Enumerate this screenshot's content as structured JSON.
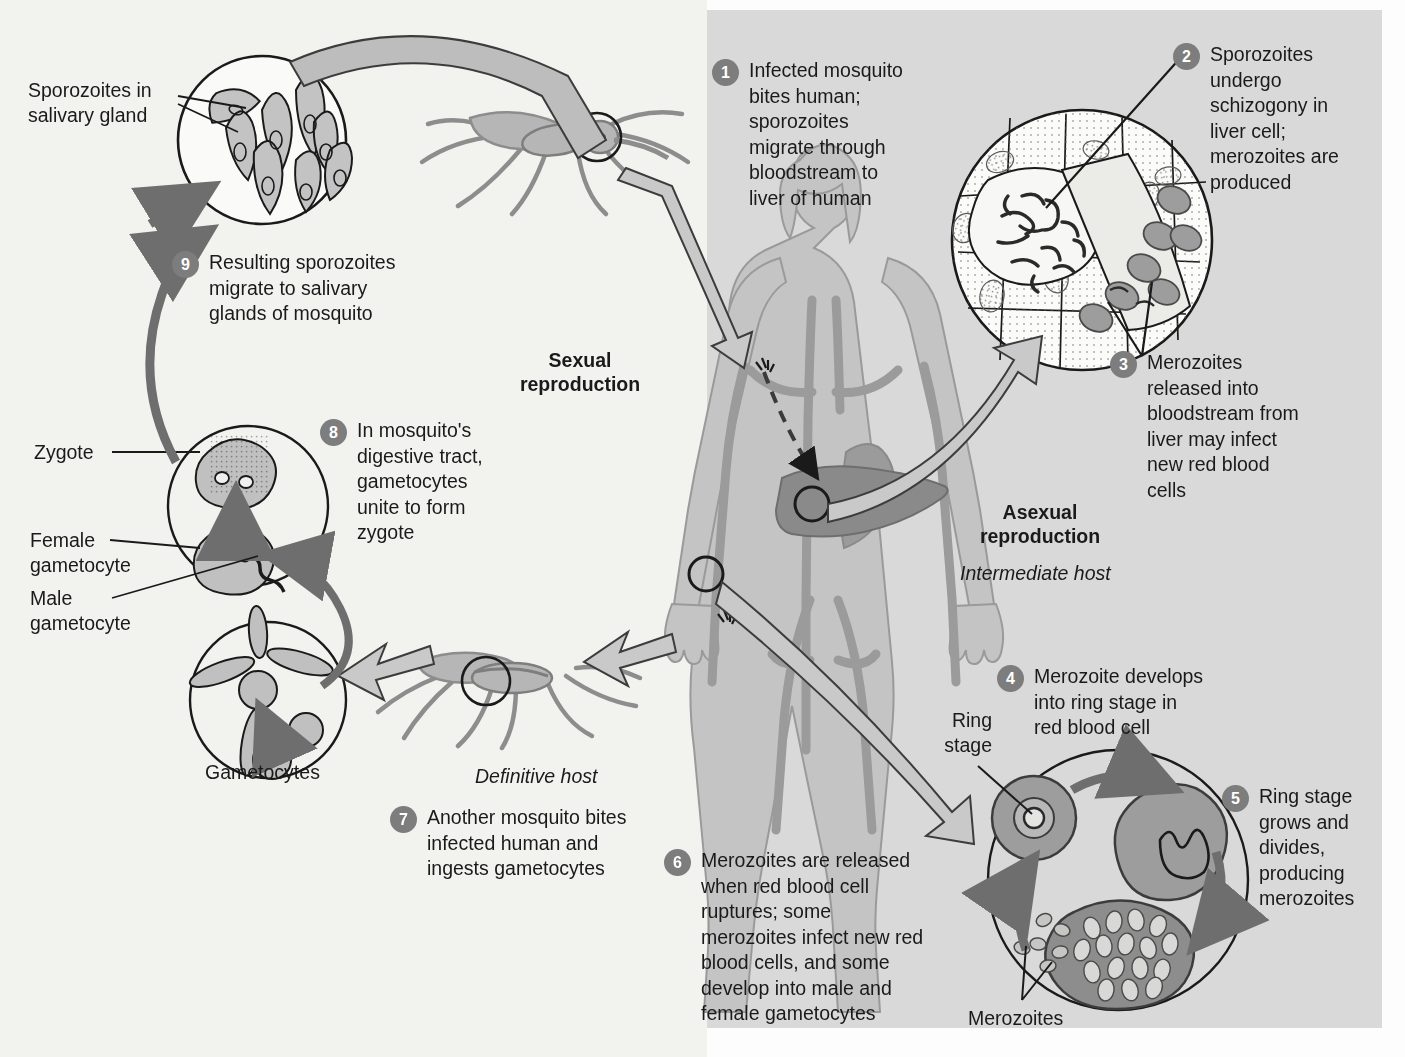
{
  "figure": {
    "headings": {
      "sexual": "Sexual\nreproduction",
      "asexual": "Asexual\nreproduction"
    },
    "hosts": {
      "definitive": "Definitive host",
      "intermediate": "Intermediate host"
    },
    "colors": {
      "panel_left": "#f2f2ef",
      "panel_right": "#d9d9d9",
      "badge": "#7d7d7d",
      "badge_text": "#ffffff",
      "ink": "#1a1a1a",
      "organism_fill": "#b6b6b6",
      "liver_fill": "#8a8a8a",
      "arrow_fill": "#c9c9c9",
      "body_fill": "#c4c4c4",
      "vessel_fill": "#9b9b9b"
    }
  },
  "steps": [
    {
      "num": "1",
      "text": "Infected mosquito\nbites human;\nsporozoites\nmigrate through\nbloodstream to\nliver of human"
    },
    {
      "num": "2",
      "text": "Sporozoites\nundergo\nschizogony in\nliver cell;\nmerozoites are\nproduced"
    },
    {
      "num": "3",
      "text": "Merozoites\nreleased into\nbloodstream from\nliver may infect\nnew red blood\ncells"
    },
    {
      "num": "4",
      "text": "Merozoite develops\ninto ring stage in\nred blood cell"
    },
    {
      "num": "5",
      "text": "Ring stage\ngrows and\ndivides,\nproducing\nmerozoites"
    },
    {
      "num": "6",
      "text": "Merozoites are released\nwhen red blood cell\nruptures; some\nmerozoites infect new red\nblood cells, and some\ndevelop into male and\nfemale gametocytes"
    },
    {
      "num": "7",
      "text": "Another mosquito bites\ninfected human and\ningests gametocytes"
    },
    {
      "num": "8",
      "text": "In mosquito's\ndigestive tract,\ngametocytes\nunite to form\nzygote"
    },
    {
      "num": "9",
      "text": "Resulting sporozoites\nmigrate to salivary\nglands of mosquito"
    }
  ],
  "labels": {
    "sporozoites_salivary": "Sporozoites in\nsalivary gland",
    "zygote": "Zygote",
    "female_gametocyte": "Female\ngametocyte",
    "male_gametocyte": "Male\ngametocyte",
    "gametocytes": "Gametocytes",
    "ring_stage": "Ring\nstage",
    "merozoites": "Merozoites"
  }
}
